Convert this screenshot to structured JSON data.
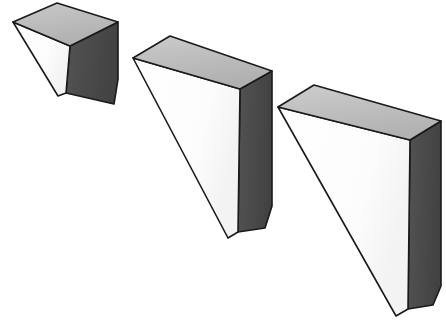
{
  "figure": {
    "title": "Three wedge-shaped triangular prisms in oblique projection",
    "background_color": "#ffffff",
    "outline_color": "#1a1a1a",
    "outline_width": 1.6,
    "palette": {
      "top_face": "#b4b4b4",
      "top_face_highlight": "#c9c9c9",
      "front_face": "#fdfdfd",
      "side_face": "#4f4f4f",
      "side_face_shadow": "#3d3d3d"
    },
    "object_count": 3,
    "objects": [
      {
        "name": "wedge-small",
        "label": "Small wedge",
        "order": 1,
        "height_rank": "shortest",
        "faces": {
          "top": "13,22 57,3 118,22 70,46",
          "front": "13,22 70,46 66,93 58,96",
          "side": "70,46 118,22 118,79 114,104 66,93"
        }
      },
      {
        "name": "wedge-medium",
        "label": "Medium wedge",
        "order": 2,
        "height_rank": "middle",
        "faces": {
          "top": "133,58 170,36 272,71 240,89",
          "front": "133,58 240,89 238,232 228,238",
          "side": "240,89 272,71 272,206 265,228 238,232"
        }
      },
      {
        "name": "wedge-large",
        "label": "Large wedge",
        "order": 3,
        "height_rank": "tallest",
        "faces": {
          "top": "278,107 314,85 441,121 410,140"
        }
      }
    ],
    "wedge_large_faces": {
      "front": "278,107 410,140 408,309 396,316",
      "side": "410,140 441,121 441,286 433,305 408,309"
    }
  }
}
